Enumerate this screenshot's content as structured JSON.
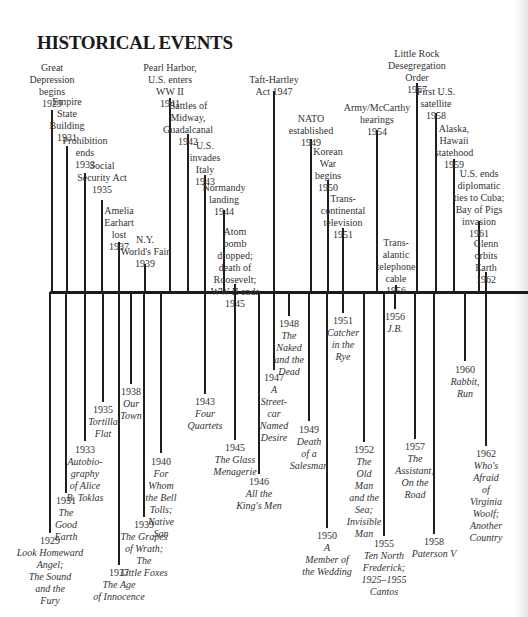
{
  "title": "HISTORICAL EVENTS",
  "chart_data": {
    "type": "timeline",
    "title": "HISTORICAL EVENTS",
    "axis": {
      "orientation": "horizontal",
      "start_year": 1929,
      "end_year": 1962
    },
    "events_above": [
      {
        "year": 1929,
        "text": "Great\nDepression\nbegins\n1929",
        "x": 52,
        "label_top": 62,
        "stem_top": 110
      },
      {
        "year": 1931,
        "text": "Empire\nState\nBuilding\n1931",
        "x": 67,
        "label_top": 96,
        "stem_top": 146
      },
      {
        "year": 1933,
        "text": "Prohibition\nends\n1933",
        "x": 85,
        "label_top": 135,
        "stem_top": 173
      },
      {
        "year": 1935,
        "text": "Social\nSecurity Act\n1935",
        "x": 102,
        "label_top": 160,
        "stem_top": 200
      },
      {
        "year": 1937,
        "text": "Amelia\nEarhart\nlost\n1937",
        "x": 119,
        "label_top": 205,
        "stem_top": 242
      },
      {
        "year": 1939,
        "text": "N.Y.\nWorld's Fair\n1939",
        "x": 145,
        "label_top": 234,
        "stem_top": 264
      },
      {
        "year": 1941,
        "text": "Pearl Harbor,\nU.S. enters\nWW II\n1941",
        "x": 170,
        "label_top": 62,
        "stem_top": 98
      },
      {
        "year": 1942,
        "text": "Battles of\nMidway,\nGuadalcanal\n1942",
        "x": 188,
        "label_top": 100,
        "stem_top": 134
      },
      {
        "year": 1943,
        "text": "U.S.\ninvades\nItaly\n1943",
        "x": 205,
        "label_top": 140,
        "stem_top": 175
      },
      {
        "year": 1944,
        "text": "Normandy\nlanding\n1944",
        "x": 224,
        "label_top": 182,
        "stem_top": 210
      },
      {
        "year": 1945,
        "text": "Atom\nbomb\ndropped;\ndeath of\nRoosevelt;\nWW II ends\n1945",
        "x": 235,
        "label_top": 226,
        "stem_top": 284
      },
      {
        "year": 1947,
        "text": "Taft-Hartley\nAct 1947",
        "x": 274,
        "label_top": 74,
        "stem_top": 91
      },
      {
        "year": 1949,
        "text": "NATO\nestablished\n1949",
        "x": 311,
        "label_top": 113,
        "stem_top": 139
      },
      {
        "year": 1950,
        "text": "Korean\nWar\nbegins\n1950",
        "x": 328,
        "label_top": 146,
        "stem_top": 180
      },
      {
        "year": 1951,
        "text": "Trans-\ncontinental\ntelevision\n1951",
        "x": 343,
        "label_top": 193,
        "stem_top": 228
      },
      {
        "year": 1954,
        "text": "Army/McCarthy\nhearings\n1954",
        "x": 377,
        "label_top": 102,
        "stem_top": 130
      },
      {
        "year": 1956,
        "text": "Trans-\nalantic\ntelephone\ncable\n1956",
        "x": 396,
        "label_top": 237,
        "stem_top": 285
      },
      {
        "year": 1957,
        "text": "Little Rock\nDesegregation\nOrder\n1957",
        "x": 417,
        "label_top": 48,
        "stem_top": 83
      },
      {
        "year": 1958,
        "text": "First U.S.\nsatellite\n1958",
        "x": 436,
        "label_top": 86,
        "stem_top": 113
      },
      {
        "year": 1959,
        "text": "Alaska,\nHawaii\nstatehood\n1959",
        "x": 454,
        "label_top": 123,
        "stem_top": 159
      },
      {
        "year": 1961,
        "text": "U.S. ends\ndiplomatic\nties to Cuba;\nBay of Pigs\ninvasion\n1961",
        "x": 479,
        "label_top": 168,
        "stem_top": 221
      },
      {
        "year": 1962,
        "text": "Glenn\norbits\nEarth\n1962",
        "x": 486,
        "label_top": 238,
        "stem_top": 272
      }
    ],
    "events_below": [
      {
        "year": 1929,
        "text": "Look Homeward\nAngel;\nThe Sound\nand the\nFury",
        "x": 50,
        "stem_bottom": 533,
        "label_top": 535
      },
      {
        "year": 1931,
        "text": "The\nGood\nEarth",
        "x": 66,
        "stem_bottom": 493,
        "label_top": 495
      },
      {
        "year": 1933,
        "text": "Autobio-\ngraphy\nof Alice\nB. Toklas",
        "x": 85,
        "stem_bottom": 441,
        "label_top": 444
      },
      {
        "year": 1935,
        "text": "Tortilla\nFlat",
        "x": 103,
        "stem_bottom": 402,
        "label_top": 404
      },
      {
        "year": 1937,
        "text": "The Age\nof Innocence",
        "x": 119,
        "stem_bottom": 565,
        "label_top": 567
      },
      {
        "year": 1938,
        "text": "Our\nTown",
        "x": 131,
        "stem_bottom": 384,
        "label_top": 386
      },
      {
        "year": 1939,
        "text": "The Grapes\nof Wrath;\nThe\nLittle Foxes",
        "x": 144,
        "stem_bottom": 517,
        "label_top": 519
      },
      {
        "year": 1940,
        "text": "For\nWhom\nthe Bell\nTolls;\nNative\nSon",
        "x": 161,
        "stem_bottom": 453,
        "label_top": 456
      },
      {
        "year": 1943,
        "text": "Four\nQuartets",
        "x": 205,
        "stem_bottom": 394,
        "label_top": 396
      },
      {
        "year": 1945,
        "text": "The Glass\nMenagerie",
        "x": 235,
        "stem_bottom": 440,
        "label_top": 442
      },
      {
        "year": 1946,
        "text": "All the\nKing's Men",
        "x": 259,
        "stem_bottom": 474,
        "label_top": 476
      },
      {
        "year": 1947,
        "text": "A\nStreet-\ncar\nNamed\nDesire",
        "x": 274,
        "stem_bottom": 370,
        "label_top": 372
      },
      {
        "year": 1948,
        "text": "The\nNaked\nand the\nDead",
        "x": 289,
        "stem_bottom": 316,
        "label_top": 318
      },
      {
        "year": 1949,
        "text": "Death\nof a\nSalesman",
        "x": 309,
        "stem_bottom": 421,
        "label_top": 424
      },
      {
        "year": 1950,
        "text": "A\nMember of\nthe Wedding",
        "x": 327,
        "stem_bottom": 528,
        "label_top": 530
      },
      {
        "year": 1951,
        "text": "Catcher\nin the\nRye",
        "x": 343,
        "stem_bottom": 313,
        "label_top": 315
      },
      {
        "year": 1952,
        "text": "The\nOld\nMan\nand the\nSea;\nInvisible\nMan",
        "x": 364,
        "stem_bottom": 442,
        "label_top": 444
      },
      {
        "year": 1955,
        "text": "Ten North\nFrederick;\n1925–1955\nCantos",
        "x": 384,
        "stem_bottom": 536,
        "label_top": 538
      },
      {
        "year": 1956,
        "text": "J.B.",
        "x": 395,
        "stem_bottom": 309,
        "label_top": 311
      },
      {
        "year": 1957,
        "text": "The\nAssistant;\nOn the\nRoad",
        "x": 415,
        "stem_bottom": 439,
        "label_top": 441
      },
      {
        "year": 1958,
        "text": "Paterson V",
        "x": 434,
        "stem_bottom": 534,
        "label_top": 536
      },
      {
        "year": 1960,
        "text": "Rabbit,\nRun",
        "x": 465,
        "stem_bottom": 361,
        "label_top": 364
      },
      {
        "year": 1962,
        "text": "Who's\nAfraid\nof\nVirginia\nWoolf;\nAnother\nCountry",
        "x": 486,
        "stem_bottom": 446,
        "label_top": 448
      }
    ]
  }
}
